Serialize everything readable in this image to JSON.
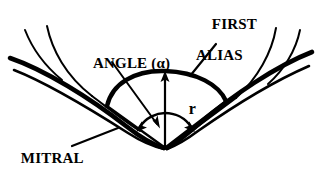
{
  "figure": {
    "kind": "line-drawing",
    "background_color": "#ffffff",
    "ink_color": "#000000"
  },
  "labels": {
    "first_alias": {
      "line1": "FIRST",
      "line2": "ALIAS"
    },
    "angle": {
      "text": "ANGLE (α)"
    },
    "mitral_leaflet": {
      "line1": "MITRAL",
      "line2": "LEAFLET"
    },
    "radius": {
      "text": "r"
    }
  },
  "annotations": {
    "radius_symbol": "r",
    "angle_symbol": "α",
    "alias_contour_name": "first alias",
    "anatomy_name": "mitral leaflet"
  },
  "geometry": {
    "orifice_vertex": {
      "x": 165,
      "y": 148
    },
    "dome_apex": {
      "x": 165,
      "y": 72
    },
    "dome_left_edge": {
      "x": 107,
      "y": 106
    },
    "dome_right_edge": {
      "x": 226,
      "y": 101
    },
    "radius_arrow": {
      "from_x": 165,
      "from_y": 148,
      "to_x": 165,
      "to_y": 72
    },
    "angle_arc_radius": 30
  }
}
